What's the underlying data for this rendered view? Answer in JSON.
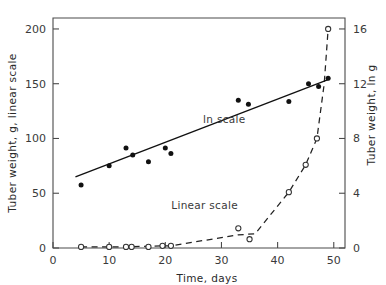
{
  "chart_data": {
    "type": "scatter",
    "title": "",
    "xlabel": "Time, days",
    "ylabel": "Tuber weight, g, linear scale",
    "y2label": "Tuber weight, ln g",
    "xlim": [
      0,
      52
    ],
    "ylim": [
      0,
      210
    ],
    "y2lim": [
      0,
      16.8
    ],
    "xticks": [
      0,
      10,
      20,
      30,
      40,
      50
    ],
    "yticks": [
      0,
      50,
      100,
      150,
      200
    ],
    "y2ticks": [
      0,
      4,
      8,
      12,
      16
    ],
    "grid": false,
    "legend_position": "inline-annotations",
    "annotations": [
      {
        "text": "ln scale",
        "x": 30.5,
        "y_ln": 9.1
      },
      {
        "text": "Linear scale",
        "x": 27.0,
        "y_linear": 36
      }
    ],
    "series": [
      {
        "name": "ln scale",
        "axis": "right",
        "marker": "filled-circle",
        "line": "solid-trend",
        "units": "ln g",
        "points": [
          {
            "x": 5.0,
            "y": 4.6
          },
          {
            "x": 10.0,
            "y": 6.0
          },
          {
            "x": 13.0,
            "y": 7.3
          },
          {
            "x": 14.2,
            "y": 6.8
          },
          {
            "x": 17.0,
            "y": 6.3
          },
          {
            "x": 20.0,
            "y": 7.3
          },
          {
            "x": 21.0,
            "y": 6.9
          },
          {
            "x": 33.0,
            "y": 10.8
          },
          {
            "x": 34.8,
            "y": 10.5
          },
          {
            "x": 42.0,
            "y": 10.7
          },
          {
            "x": 45.5,
            "y": 12.0
          },
          {
            "x": 47.3,
            "y": 11.8
          },
          {
            "x": 49.0,
            "y": 12.4
          }
        ],
        "trend_line": [
          {
            "x": 4.0,
            "y": 5.2
          },
          {
            "x": 49.0,
            "y": 12.3
          }
        ]
      },
      {
        "name": "Linear scale",
        "axis": "left",
        "marker": "open-circle",
        "line": "dashed",
        "units": "g",
        "points": [
          {
            "x": 5.0,
            "y": 1
          },
          {
            "x": 10.0,
            "y": 1
          },
          {
            "x": 13.0,
            "y": 1
          },
          {
            "x": 14.0,
            "y": 1
          },
          {
            "x": 17.0,
            "y": 1
          },
          {
            "x": 19.5,
            "y": 2
          },
          {
            "x": 21.0,
            "y": 2
          },
          {
            "x": 33.0,
            "y": 18
          },
          {
            "x": 35.0,
            "y": 8
          },
          {
            "x": 42.0,
            "y": 51
          },
          {
            "x": 45.0,
            "y": 76
          },
          {
            "x": 47.0,
            "y": 100
          },
          {
            "x": 49.0,
            "y": 200
          }
        ],
        "curve": [
          {
            "x": 5.0,
            "y": 1
          },
          {
            "x": 13.0,
            "y": 1
          },
          {
            "x": 19.5,
            "y": 2
          },
          {
            "x": 21.0,
            "y": 2
          },
          {
            "x": 33.0,
            "y": 12
          },
          {
            "x": 36.0,
            "y": 13
          },
          {
            "x": 42.0,
            "y": 51
          },
          {
            "x": 45.0,
            "y": 76
          },
          {
            "x": 47.0,
            "y": 100
          },
          {
            "x": 48.3,
            "y": 150
          },
          {
            "x": 49.0,
            "y": 200
          }
        ]
      }
    ]
  }
}
